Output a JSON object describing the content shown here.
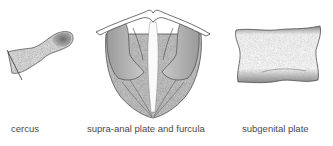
{
  "figure": {
    "panels": [
      {
        "id": "cercus",
        "label": "cercus"
      },
      {
        "id": "supra-anal-plate-and-furcula",
        "label": "supra-anal plate and furcula"
      },
      {
        "id": "subgenital-plate",
        "label": "subgenital plate"
      }
    ],
    "colors": {
      "background": "#ffffff",
      "ink": "#2a2a2a",
      "stipple": "#7a7a7a",
      "label": "#4a4a4a"
    }
  }
}
